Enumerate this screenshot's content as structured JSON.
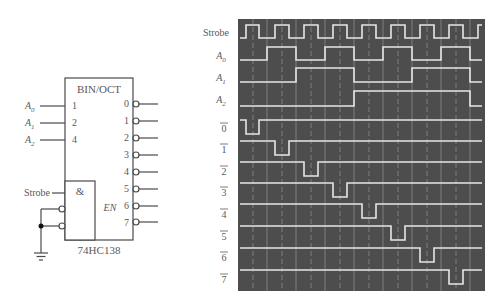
{
  "decoder": {
    "title": "BIN/OCT",
    "part_number": "74HC138",
    "inputs": [
      {
        "name": "A",
        "sub": "0",
        "weight": "1"
      },
      {
        "name": "A",
        "sub": "1",
        "weight": "2"
      },
      {
        "name": "A",
        "sub": "2",
        "weight": "4"
      }
    ],
    "outputs": [
      "0",
      "1",
      "2",
      "3",
      "4",
      "5",
      "6",
      "7"
    ],
    "enable_gate_symbol": "&",
    "enable_label": "EN",
    "strobe_label": "Strobe"
  },
  "timing_diagram": {
    "colors": {
      "background": "#4d4d4d",
      "trace": "#e6e6e6",
      "grid": "#8a8a8a"
    },
    "signals": [
      {
        "label": "Strobe",
        "sub": ""
      },
      {
        "label": "A",
        "sub": "0"
      },
      {
        "label": "A",
        "sub": "1"
      },
      {
        "label": "A",
        "sub": "2"
      },
      {
        "label": "0",
        "overbar": true
      },
      {
        "label": "1",
        "overbar": true
      },
      {
        "label": "2",
        "overbar": true
      },
      {
        "label": "3",
        "overbar": true
      },
      {
        "label": "4",
        "overbar": true
      },
      {
        "label": "5",
        "overbar": true
      },
      {
        "label": "6",
        "overbar": true
      },
      {
        "label": "7",
        "overbar": true
      }
    ]
  }
}
